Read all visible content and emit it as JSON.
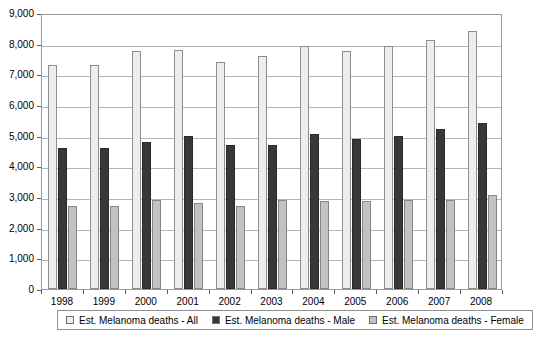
{
  "chart_data": {
    "type": "bar",
    "title": "",
    "subtitle": "",
    "xlabel": "",
    "ylabel": "",
    "categories": [
      "1998",
      "1999",
      "2000",
      "2001",
      "2002",
      "2003",
      "2004",
      "2005",
      "2006",
      "2007",
      "2008"
    ],
    "series": [
      {
        "name": "Est. Melanoma deaths - All",
        "color": "#ededed",
        "values": [
          7300,
          7300,
          7770,
          7800,
          7400,
          7600,
          7910,
          7770,
          7910,
          8110,
          8420
        ]
      },
      {
        "name": "Est. Melanoma deaths - Male",
        "color": "#383838",
        "values": [
          4600,
          4600,
          4800,
          5000,
          4700,
          4700,
          5050,
          4900,
          5000,
          5220,
          5400
        ]
      },
      {
        "name": "Est. Melanoma deaths - Female",
        "color": "#c2c2c2",
        "values": [
          2700,
          2700,
          2900,
          2800,
          2700,
          2900,
          2880,
          2880,
          2900,
          2900,
          3060
        ]
      }
    ],
    "ylim": [
      0,
      9000
    ],
    "ytick_values": [
      0,
      1000,
      2000,
      3000,
      4000,
      5000,
      6000,
      7000,
      8000,
      9000
    ],
    "ytick_labels": [
      "0",
      "1,000",
      "2,000",
      "3,000",
      "4,000",
      "5,000",
      "6,000",
      "7,000",
      "8,000",
      "9,000"
    ],
    "grid": true,
    "grid_axis": "y",
    "legend_position": "bottom"
  },
  "legend": {
    "entries": [
      {
        "label": "Est. Melanoma deaths - All"
      },
      {
        "label": "Est. Melanoma deaths - Male"
      },
      {
        "label": "Est. Melanoma deaths - Female"
      }
    ]
  }
}
